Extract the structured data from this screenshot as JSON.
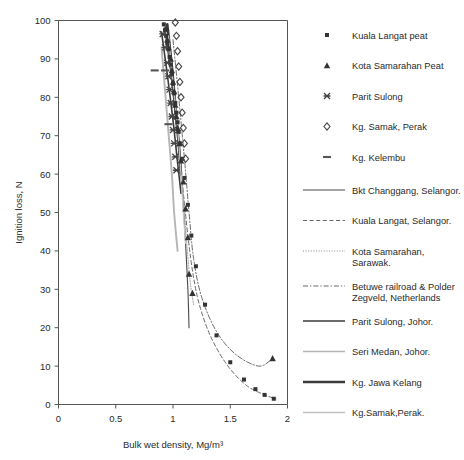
{
  "figure": {
    "clipped_top_text": "",
    "background": "#ffffff"
  },
  "axes": {
    "y": {
      "label": "Ignition loss, N",
      "ticks": [
        "0",
        "10",
        "20",
        "30",
        "40",
        "50",
        "60",
        "70",
        "80",
        "90",
        "100"
      ],
      "min": 0,
      "max": 100,
      "step": 10
    },
    "x": {
      "label": "Bulk wet density, Mg/m³",
      "ticks": [
        "0",
        "0.5",
        "1",
        "1.5",
        "2"
      ],
      "min": 0,
      "max": 2,
      "step": 0.5
    },
    "frame_color": "#555555",
    "grid": false
  },
  "legend": {
    "position": "right",
    "markers": [
      {
        "label": "Kuala Langat peat",
        "glyph": "small-filled-square-marker",
        "color": "#333333"
      },
      {
        "label": "Kota Samarahan Peat",
        "glyph": "filled-triangle-marker",
        "color": "#333333"
      },
      {
        "label": "Parit Sulong",
        "glyph": "cross-star-marker",
        "color": "#444444"
      },
      {
        "label": "Kg. Samak, Perak",
        "glyph": "open-diamond-marker",
        "color": "#444444"
      },
      {
        "label": "Kg. Kelembu",
        "glyph": "dash-marker",
        "color": "#555555"
      }
    ],
    "lines": [
      {
        "label": "Bkt Changgang, Selangor.",
        "style": "solid",
        "width": 1.2,
        "color": "#4a4a4a"
      },
      {
        "label": "Kuala Langat, Selangor.",
        "style": "dashed",
        "width": 1.1,
        "color": "#6a6a6a"
      },
      {
        "label": "Kota Samarahan, Sarawak.",
        "style": "dotted",
        "width": 1.0,
        "color": "#8a8a8a"
      },
      {
        "label": "Betuwe railroad & Polder Zegveld, Netherlands",
        "style": "dashdot",
        "width": 1.1,
        "color": "#6a6a6a"
      },
      {
        "label": "Parit Sulong, Johor.",
        "style": "solid",
        "width": 1.6,
        "color": "#3a3a3a"
      },
      {
        "label": "Seri Medan, Johor.",
        "style": "solid",
        "width": 1.7,
        "color": "#b5b5b5"
      },
      {
        "label": "Kg. Jawa Kelang",
        "style": "solid",
        "width": 2.6,
        "color": "#3a3a3a"
      },
      {
        "label": "Kg.Samak,Perak.",
        "style": "solid",
        "width": 1.3,
        "color": "#c2c2c2"
      }
    ]
  },
  "chart_data": {
    "type": "scatter",
    "title": "",
    "xlabel": "Bulk wet density, Mg/m³",
    "ylabel": "Ignition loss, N",
    "xlim": [
      0,
      2
    ],
    "ylim": [
      0,
      100
    ],
    "grid": false,
    "series": [
      {
        "name": "Kuala Langat peat",
        "marker": "small-filled-square-marker",
        "points": [
          [
            0.92,
            99.0
          ],
          [
            0.93,
            97.5
          ],
          [
            0.94,
            96.0
          ],
          [
            0.95,
            94.0
          ],
          [
            0.96,
            92.5
          ],
          [
            0.97,
            90.5
          ],
          [
            0.98,
            88.5
          ],
          [
            0.99,
            86.0
          ],
          [
            1.0,
            83.5
          ],
          [
            1.01,
            81.0
          ],
          [
            1.02,
            78.5
          ],
          [
            1.03,
            76.0
          ],
          [
            1.04,
            73.5
          ],
          [
            1.05,
            71.0
          ],
          [
            1.06,
            68.0
          ],
          [
            1.08,
            64.0
          ],
          [
            1.1,
            59.0
          ],
          [
            1.13,
            52.0
          ],
          [
            1.16,
            44.0
          ],
          [
            1.2,
            36.0
          ],
          [
            1.28,
            26.0
          ],
          [
            1.38,
            18.0
          ],
          [
            1.5,
            11.0
          ],
          [
            1.62,
            6.5
          ],
          [
            1.72,
            4.0
          ],
          [
            1.8,
            2.5
          ],
          [
            1.88,
            1.5
          ]
        ]
      },
      {
        "name": "Kota Samarahan Peat",
        "marker": "filled-triangle-marker",
        "points": [
          [
            0.94,
            98.0
          ],
          [
            0.95,
            95.0
          ],
          [
            0.96,
            93.0
          ],
          [
            0.98,
            90.0
          ],
          [
            0.99,
            87.0
          ],
          [
            1.0,
            84.0
          ],
          [
            1.01,
            81.5
          ],
          [
            1.02,
            78.0
          ],
          [
            1.03,
            75.0
          ],
          [
            1.04,
            72.0
          ],
          [
            1.06,
            68.0
          ],
          [
            1.07,
            63.5
          ],
          [
            1.09,
            58.0
          ],
          [
            1.11,
            51.0
          ],
          [
            1.13,
            43.5
          ],
          [
            1.14,
            34.0
          ],
          [
            1.17,
            29.0
          ],
          [
            1.87,
            12.0
          ]
        ]
      },
      {
        "name": "Parit Sulong",
        "marker": "cross-star-marker",
        "points": [
          [
            0.91,
            96.5
          ],
          [
            0.93,
            93.0
          ],
          [
            0.95,
            89.0
          ],
          [
            0.96,
            85.5
          ],
          [
            0.97,
            82.0
          ],
          [
            0.98,
            78.5
          ],
          [
            0.99,
            75.0
          ],
          [
            1.0,
            71.5
          ],
          [
            1.01,
            68.0
          ],
          [
            1.02,
            64.5
          ],
          [
            1.03,
            61.0
          ]
        ]
      },
      {
        "name": "Kg. Samak, Perak",
        "marker": "open-diamond-marker",
        "points": [
          [
            1.02,
            99.5
          ],
          [
            1.03,
            96.0
          ],
          [
            1.04,
            92.0
          ],
          [
            1.05,
            88.0
          ],
          [
            1.06,
            84.0
          ],
          [
            1.07,
            80.0
          ],
          [
            1.08,
            76.0
          ],
          [
            1.09,
            72.0
          ],
          [
            1.1,
            68.0
          ],
          [
            1.11,
            64.0
          ]
        ]
      },
      {
        "name": "Kg. Kelembu",
        "marker": "dash-marker",
        "points": [
          [
            0.84,
            87.0
          ],
          [
            0.93,
            87.0
          ],
          [
            0.96,
            73.0
          ]
        ]
      }
    ],
    "fit_lines": [
      {
        "name": "Bkt Changgang, Selangor.",
        "style": "solid",
        "path": [
          [
            0.93,
            98
          ],
          [
            0.99,
            84
          ],
          [
            1.04,
            70
          ],
          [
            1.08,
            56
          ],
          [
            1.11,
            42
          ],
          [
            1.13,
            30
          ],
          [
            1.14,
            20
          ]
        ]
      },
      {
        "name": "Kuala Langat, Selangor.",
        "style": "dashed",
        "path": [
          [
            0.92,
            99
          ],
          [
            0.98,
            86
          ],
          [
            1.03,
            72
          ],
          [
            1.08,
            58
          ],
          [
            1.13,
            44
          ],
          [
            1.18,
            33
          ],
          [
            1.24,
            25
          ],
          [
            1.34,
            17
          ],
          [
            1.48,
            10
          ],
          [
            1.64,
            5
          ],
          [
            1.8,
            2.5
          ],
          [
            1.9,
            1.5
          ]
        ]
      },
      {
        "name": "Kota Samarahan, Sarawak.",
        "style": "dotted",
        "path": [
          [
            0.95,
            97
          ],
          [
            1.0,
            83
          ],
          [
            1.05,
            69
          ],
          [
            1.09,
            55
          ],
          [
            1.12,
            42
          ],
          [
            1.15,
            32
          ],
          [
            1.18,
            26
          ]
        ]
      },
      {
        "name": "Betuwe railroad & Polder Zegveld, Netherlands",
        "style": "dashdot",
        "path": [
          [
            1.0,
            95
          ],
          [
            1.05,
            80
          ],
          [
            1.1,
            64
          ],
          [
            1.14,
            50
          ],
          [
            1.18,
            38
          ],
          [
            1.25,
            28
          ],
          [
            1.38,
            19
          ],
          [
            1.55,
            13
          ],
          [
            1.75,
            10
          ],
          [
            1.87,
            12
          ]
        ]
      },
      {
        "name": "Parit Sulong, Johor.",
        "style": "solid-medium",
        "path": [
          [
            0.9,
            97
          ],
          [
            0.95,
            86
          ],
          [
            1.0,
            74
          ],
          [
            1.04,
            63
          ],
          [
            1.07,
            55
          ]
        ]
      },
      {
        "name": "Seri Medan, Johor.",
        "style": "solid-gray",
        "path": [
          [
            0.9,
            93
          ],
          [
            0.93,
            82
          ],
          [
            0.96,
            71
          ],
          [
            0.99,
            60
          ],
          [
            1.01,
            50
          ],
          [
            1.04,
            40
          ]
        ]
      },
      {
        "name": "Kg. Jawa Kelang",
        "style": "solid-thick",
        "path": [
          [
            0.95,
            99
          ],
          [
            0.99,
            88
          ],
          [
            1.02,
            78
          ],
          [
            1.05,
            68
          ],
          [
            1.07,
            60
          ]
        ]
      },
      {
        "name": "Kg.Samak,Perak.",
        "style": "solid-lightgray",
        "path": [
          [
            0.96,
            96
          ],
          [
            1.0,
            84
          ],
          [
            1.04,
            72
          ],
          [
            1.07,
            60
          ],
          [
            1.09,
            50
          ],
          [
            1.11,
            42
          ]
        ]
      }
    ]
  }
}
